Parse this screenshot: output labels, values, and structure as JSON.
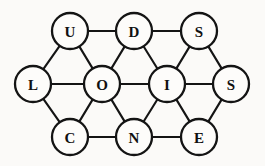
{
  "figure": {
    "name": "letter-graph-diagram",
    "type": "undirected-graph",
    "background_color": "#fbfaf8",
    "ink_color": "#141414",
    "node_fill_color": "#fdfcfa",
    "width": 265,
    "height": 166,
    "node_radius": 18
  },
  "graph_data": {
    "type": "graph",
    "layout": "triangular-lattice",
    "rows": [
      {
        "name": "top-row",
        "y": 31,
        "letters": [
          "U",
          "D",
          "S"
        ]
      },
      {
        "name": "middle-row",
        "y": 84,
        "letters": [
          "L",
          "O",
          "I",
          "S"
        ]
      },
      {
        "name": "bottom-row",
        "y": 137,
        "letters": [
          "C",
          "N",
          "E"
        ]
      }
    ],
    "nodes": [
      {
        "id": "U",
        "label": "U",
        "x": 70,
        "y": 31
      },
      {
        "id": "D",
        "label": "D",
        "x": 134,
        "y": 31
      },
      {
        "id": "S1",
        "label": "S",
        "x": 199,
        "y": 31
      },
      {
        "id": "L",
        "label": "L",
        "x": 33,
        "y": 84
      },
      {
        "id": "O",
        "label": "O",
        "x": 102,
        "y": 84
      },
      {
        "id": "I",
        "label": "I",
        "x": 167,
        "y": 84
      },
      {
        "id": "S2",
        "label": "S",
        "x": 231,
        "y": 84
      },
      {
        "id": "C",
        "label": "C",
        "x": 70,
        "y": 137
      },
      {
        "id": "N",
        "label": "N",
        "x": 134,
        "y": 137
      },
      {
        "id": "E",
        "label": "E",
        "x": 199,
        "y": 137
      }
    ],
    "edges": [
      {
        "from": "U",
        "to": "D"
      },
      {
        "from": "D",
        "to": "S1"
      },
      {
        "from": "L",
        "to": "O"
      },
      {
        "from": "O",
        "to": "I"
      },
      {
        "from": "I",
        "to": "S2"
      },
      {
        "from": "C",
        "to": "N"
      },
      {
        "from": "N",
        "to": "E"
      },
      {
        "from": "U",
        "to": "L"
      },
      {
        "from": "U",
        "to": "O"
      },
      {
        "from": "D",
        "to": "O"
      },
      {
        "from": "D",
        "to": "I"
      },
      {
        "from": "S1",
        "to": "I"
      },
      {
        "from": "S1",
        "to": "S2"
      },
      {
        "from": "L",
        "to": "C"
      },
      {
        "from": "O",
        "to": "C"
      },
      {
        "from": "O",
        "to": "N"
      },
      {
        "from": "I",
        "to": "N"
      },
      {
        "from": "I",
        "to": "E"
      },
      {
        "from": "S2",
        "to": "E"
      }
    ]
  }
}
